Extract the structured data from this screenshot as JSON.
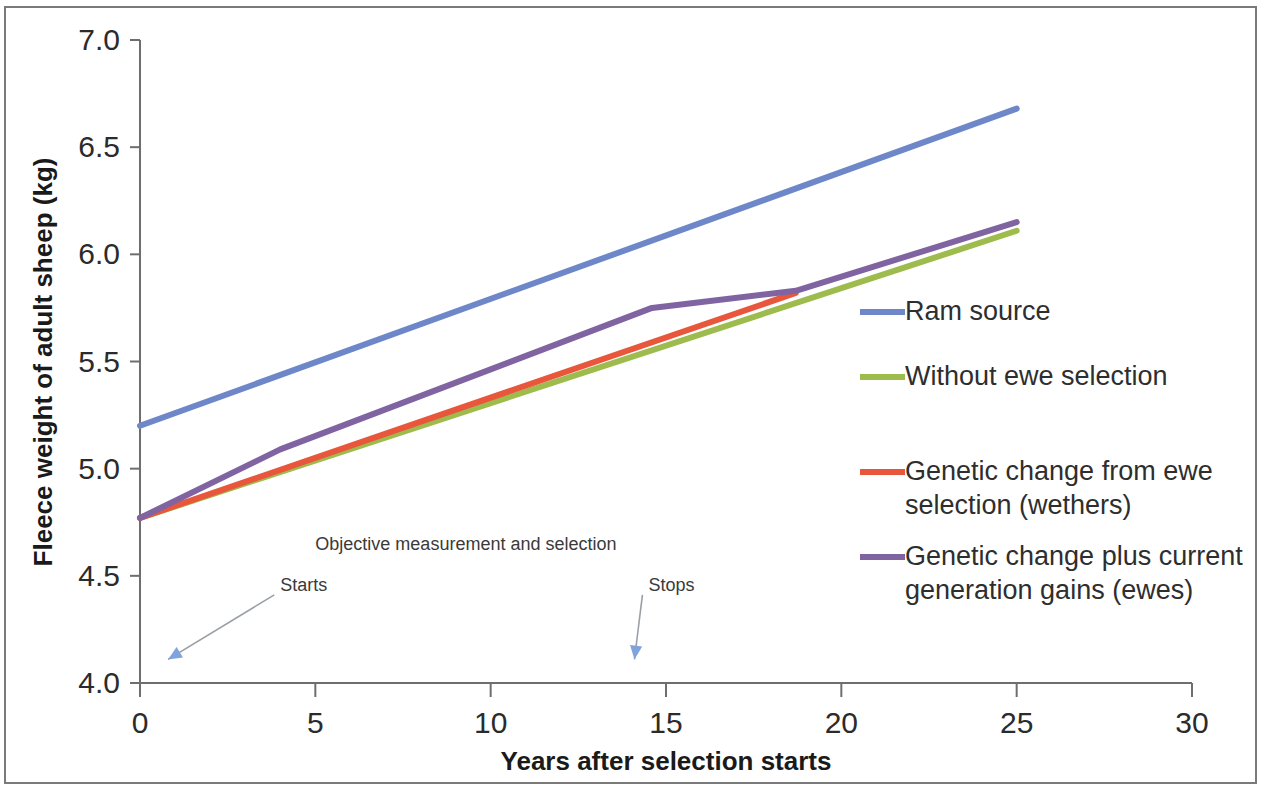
{
  "chart_data": {
    "type": "line",
    "title": "",
    "xlabel": "Years after selection starts",
    "ylabel": "Fleece weight of adult sheep (kg)",
    "xlim": [
      0,
      30
    ],
    "ylim": [
      4.0,
      7.0
    ],
    "xticks": [
      0,
      5,
      10,
      15,
      20,
      25,
      30
    ],
    "xtick_labels": [
      "0",
      "5",
      "10",
      "15",
      "20",
      "25",
      "30"
    ],
    "yticks": [
      4.0,
      4.5,
      5.0,
      5.5,
      6.0,
      6.5,
      7.0
    ],
    "ytick_labels": [
      "4.0",
      "4.5",
      "5.0",
      "5.5",
      "6.0",
      "6.5",
      "7.0"
    ],
    "grid": false,
    "legend_position": "right",
    "series": [
      {
        "name": "Ram source",
        "color": "#6d87c9",
        "x": [
          0,
          25
        ],
        "y": [
          5.2,
          6.68
        ]
      },
      {
        "name": "Without ewe selection",
        "color": "#9ebb4d",
        "x": [
          0,
          25
        ],
        "y": [
          4.77,
          6.11
        ]
      },
      {
        "name": "Genetic change from ewe selection (wethers)",
        "color": "#e8573b",
        "x": [
          0,
          18.7
        ],
        "y": [
          4.77,
          5.82
        ]
      },
      {
        "name": "Genetic change plus current generation gains (ewes)",
        "color": "#8064a2",
        "x": [
          0,
          4.0,
          14.6,
          18.7,
          25
        ],
        "y": [
          4.77,
          5.09,
          5.75,
          5.83,
          6.15
        ]
      }
    ],
    "annotations": [
      {
        "text": "Objective measurement  and selection",
        "x": 5.0,
        "y": 4.62
      },
      {
        "text": "Starts",
        "x": 4.0,
        "y": 4.43,
        "arrow_to_x": 0.8,
        "arrow_to_y": 4.11
      },
      {
        "text": "Stops",
        "x": 14.5,
        "y": 4.43,
        "arrow_to_x": 14.1,
        "arrow_to_y": 4.11
      }
    ]
  },
  "legend": {
    "items": [
      {
        "label_line1": "Ram source",
        "label_line2": ""
      },
      {
        "label_line1": "Without ewe selection",
        "label_line2": ""
      },
      {
        "label_line1": "Genetic change from ewe",
        "label_line2": "selection (wethers)"
      },
      {
        "label_line1": "Genetic change plus current",
        "label_line2": "generation gains (ewes)"
      }
    ]
  }
}
